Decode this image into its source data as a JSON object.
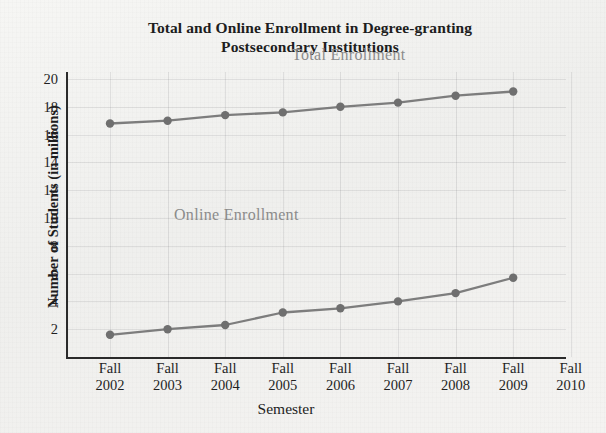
{
  "chart_data": {
    "type": "line",
    "title": "Total and Online Enrollment in Degree-granting Postsecondary Institutions",
    "title_line1": "Total and Online Enrollment in Degree-granting",
    "title_line2": "Postsecondary Institutions",
    "xlabel": "Semester",
    "ylabel": "Number of Students (in millions)",
    "categories": [
      "Fall 2002",
      "Fall 2003",
      "Fall 2004",
      "Fall 2005",
      "Fall 2006",
      "Fall 2007",
      "Fall 2008",
      "Fall 2009",
      "Fall 2010"
    ],
    "category_terms": [
      "Fall",
      "Fall",
      "Fall",
      "Fall",
      "Fall",
      "Fall",
      "Fall",
      "Fall",
      "Fall"
    ],
    "category_years": [
      "2002",
      "2003",
      "2004",
      "2005",
      "2006",
      "2007",
      "2008",
      "2009",
      "2010"
    ],
    "ylim": [
      0,
      20
    ],
    "y_ticks": [
      20,
      18,
      16,
      14,
      12,
      10,
      8,
      6,
      4,
      2
    ],
    "grid": true,
    "grid_orientation": "both",
    "legend_position": "inline-labels",
    "series": [
      {
        "name": "Total Enrollment",
        "color": "#7d7d7d",
        "values": [
          16.8,
          17.0,
          17.4,
          17.6,
          18.0,
          18.3,
          18.8,
          19.1,
          null
        ]
      },
      {
        "name": "Online Enrollment",
        "color": "#7d7d7d",
        "values": [
          1.6,
          2.0,
          2.3,
          3.2,
          3.5,
          4.0,
          4.6,
          5.7,
          null
        ]
      }
    ],
    "annotations": [
      {
        "text": "Total Enrollment",
        "series": "Total Enrollment"
      },
      {
        "text": "Online Enrollment",
        "series": "Online Enrollment"
      }
    ]
  },
  "colors": {
    "background": "#f2f2f0",
    "axis": "#2a2a2a",
    "series_line": "#7d7d7d",
    "series_marker": "#6f6f6f",
    "series_label_text": "#8b8b8b",
    "gridline": "#e2e2e4",
    "text": "#1d1d1d"
  }
}
